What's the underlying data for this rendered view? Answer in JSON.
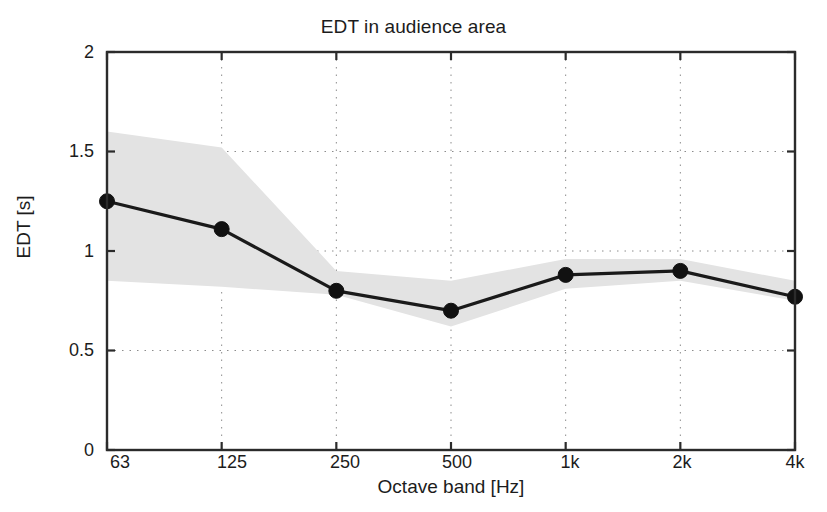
{
  "chart_data": {
    "type": "line",
    "title": "EDT in audience area",
    "xlabel": "Octave band [Hz]",
    "ylabel": "EDT [s]",
    "categories": [
      "63",
      "125",
      "250",
      "500",
      "1k",
      "2k",
      "4k"
    ],
    "values": [
      1.25,
      1.11,
      0.8,
      0.7,
      0.88,
      0.9,
      0.77
    ],
    "band_upper": [
      1.6,
      1.52,
      0.9,
      0.85,
      0.96,
      0.96,
      0.85
    ],
    "band_lower": [
      0.85,
      0.82,
      0.78,
      0.62,
      0.81,
      0.85,
      0.75
    ],
    "series": [
      {
        "name": "EDT mean",
        "values": [
          1.25,
          1.11,
          0.8,
          0.7,
          0.88,
          0.9,
          0.77
        ]
      },
      {
        "name": "spread band upper",
        "values": [
          1.6,
          1.52,
          0.9,
          0.85,
          0.96,
          0.96,
          0.85
        ]
      },
      {
        "name": "spread band lower",
        "values": [
          0.85,
          0.82,
          0.78,
          0.62,
          0.81,
          0.85,
          0.75
        ]
      }
    ],
    "ylim": [
      0,
      2
    ],
    "yticks": [
      0,
      0.5,
      1,
      1.5,
      2
    ],
    "ytick_labels": [
      "0",
      "0.5",
      "1",
      "1.5",
      "2"
    ],
    "grid": true,
    "grid_style": "dotted",
    "legend": null,
    "colors": {
      "line": "#1a1a1a",
      "marker": "#111111",
      "band": "#e3e3e3",
      "axis": "#2b2b2b",
      "grid": "#8c8c8c",
      "background": "#ffffff"
    }
  }
}
